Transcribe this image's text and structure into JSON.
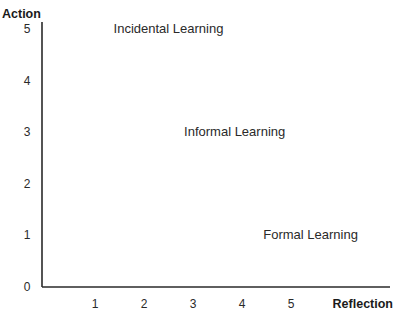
{
  "chart_data": {
    "type": "scatter",
    "title": "",
    "xlabel": "Reflection",
    "ylabel": "Action",
    "xlim": [
      0,
      6.1
    ],
    "ylim": [
      0,
      5
    ],
    "x_ticks": [
      "1",
      "2",
      "3",
      "4",
      "5"
    ],
    "y_ticks": [
      "0",
      "1",
      "2",
      "3",
      "4",
      "5"
    ],
    "grid": false,
    "legend": "none",
    "annotations": [
      {
        "text": "Incidental Learning",
        "x": 2.5,
        "y": 5
      },
      {
        "text": "Informal Learning",
        "x": 3.85,
        "y": 3
      },
      {
        "text": "Formal Learning",
        "x": 5.4,
        "y": 1
      }
    ]
  }
}
